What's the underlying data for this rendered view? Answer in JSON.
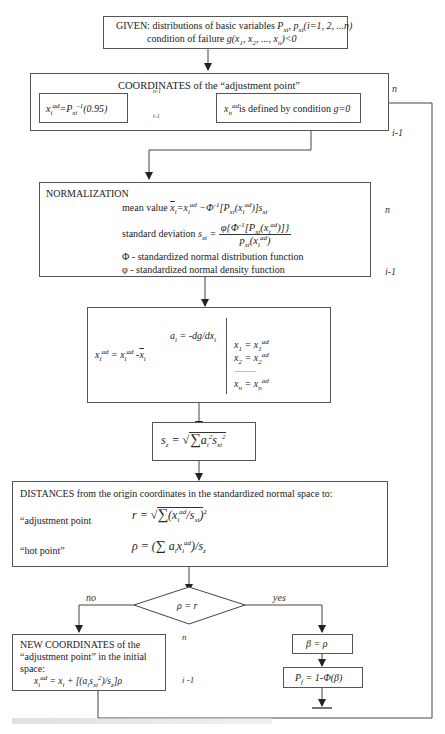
{
  "given": {
    "line1_prefix": "GIVEN: distributions of basic variables ",
    "line1_math": "P",
    "line1_rest": "xi, pxi(i=1, 2, ...n)",
    "line2_prefix": "condition of failure ",
    "line2_math": "g(x1, x2, ..., xn)<0"
  },
  "coordinates": {
    "title": "COORDINATES of the “adjustment point”",
    "left_formula": "xiad=Pxi-1(0.95)",
    "right_formula_math": "xnad",
    "right_formula_text": "is defined by condition ",
    "right_formula_cond": "g=0",
    "arrow_label_top": "n-1",
    "arrow_label_bottom": "i-1",
    "loop_label_top": "n",
    "loop_label_bottom": "i-1"
  },
  "normalization": {
    "title": "NORMALIZATION",
    "mean_label": "mean value ",
    "mean_formula": "x̄i=xiad −Φ-1[Pxi(xiad)]sxi",
    "std_label": "standard deviation ",
    "std_lhs": "sxi =",
    "std_num": "φ{Φ-1[Pxi(xiad)]}",
    "std_den": "pxi(xiad)",
    "phi_upper_def": "Φ - standardized normal distribution function",
    "phi_lower_def": "φ - standardized normal density function",
    "loop_label_top": "n",
    "loop_label_bottom": "i-1"
  },
  "gradient": {
    "ai_formula": "ai = -dg/dxi",
    "xi_formula": "xiad = xiad -x̄i",
    "subs": [
      "x1 = x1ad",
      "x2 = x2ad",
      "...........",
      "xn = xnad"
    ]
  },
  "sz": {
    "formula": "sz = √∑ ai² sxi²"
  },
  "distances": {
    "title": "DISTANCES from the origin coordinates in the standardized normal space to:",
    "adj_label": "“adjustment point",
    "adj_formula": "r = √∑(xiad / sxi)²",
    "hot_label": "“hot point”",
    "hot_formula": "ρ = (∑ aixiad)/sz"
  },
  "decision": {
    "condition": "ρ = r",
    "no_label": "no",
    "yes_label": "yes",
    "n_label": "n",
    "i_label": "i -1"
  },
  "new_coords": {
    "line1": "NEW COORDINATES of the",
    "line2": "“adjustment point” in the initial",
    "line3": "space:",
    "formula": "xiad = xi + [(aisxi²)/sz]ρ"
  },
  "beta": {
    "formula": "β = ρ"
  },
  "pf": {
    "formula": "Pf = 1-Φ(β)"
  }
}
